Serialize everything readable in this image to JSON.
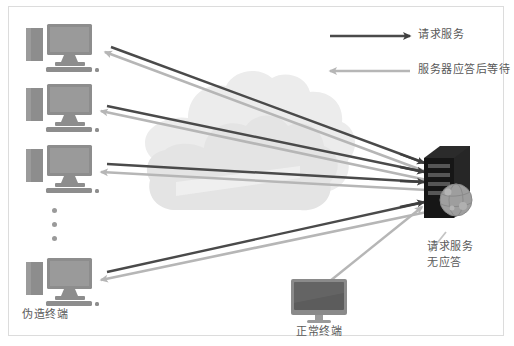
{
  "diagram": {
    "title_present": false,
    "background_color": "#ffffff",
    "border_color": "#dcdcdc",
    "colors": {
      "request_arrow": "#4a4a4a",
      "response_arrow": "#b6b6b6",
      "terminal_icon": "#8d8d8d",
      "server_icon": "#1d1d1d",
      "cloud": "#ececec",
      "text": "#5a5a5a",
      "dots": "#9a9a9a"
    }
  },
  "legend": {
    "items": [
      {
        "label": "请求服务",
        "arrow_direction": "right",
        "arrow_color": "#4a4a4a",
        "icon": "right-arrow-icon"
      },
      {
        "label": "服务器应答后等待",
        "arrow_direction": "left",
        "arrow_color": "#b6b6b6",
        "icon": "left-arrow-icon"
      }
    ]
  },
  "nodes": {
    "fake_terminals": {
      "label": "伪造终端",
      "icon": "desktop-computer-icon",
      "count_shown": 4,
      "continuation_marker": "vertical-ellipsis"
    },
    "normal_terminal": {
      "label": "正常终端",
      "icon": "all-in-one-monitor-icon"
    },
    "server": {
      "icon": "server-tower-icon",
      "globe_icon": "globe-icon"
    },
    "network_cloud": {
      "icon": "cloud-icon"
    }
  },
  "annotations": {
    "no_response": {
      "line1": "请求服务",
      "line2": "无应答"
    }
  },
  "connections": [
    {
      "from": "fake-terminal-1",
      "to": "server",
      "request": true,
      "response": true
    },
    {
      "from": "fake-terminal-2",
      "to": "server",
      "request": true,
      "response": true
    },
    {
      "from": "fake-terminal-3",
      "to": "server",
      "request": true,
      "response": true
    },
    {
      "from": "fake-terminal-4",
      "to": "server",
      "request": true,
      "response": true
    },
    {
      "from": "normal-terminal",
      "to": "server",
      "request": true,
      "response": false
    }
  ]
}
